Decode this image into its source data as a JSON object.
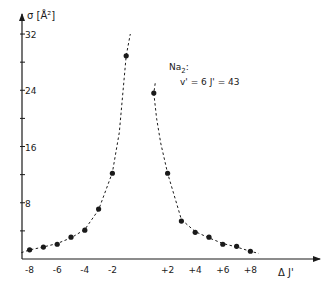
{
  "chart_data": {
    "type": "scatter",
    "title": "",
    "annotation": {
      "line1": "Na",
      "line1_sub": "2",
      "line1_suffix": ":",
      "line2": "v' = 6   J' = 43"
    },
    "xlabel": "Δ J'",
    "ylabel": "σ [Å²]",
    "xlim": [
      -9,
      13
    ],
    "ylim": [
      0,
      34
    ],
    "grid": false,
    "legend": null,
    "x_ticks": [
      -8,
      -7,
      -6,
      -5,
      -4,
      -3,
      -2,
      2,
      3,
      4,
      5,
      6,
      7,
      8
    ],
    "x_tick_labels": [
      {
        "value": -8,
        "label": "-8"
      },
      {
        "value": -6,
        "label": "-6"
      },
      {
        "value": -4,
        "label": "-4"
      },
      {
        "value": -2,
        "label": "-2"
      },
      {
        "value": 2,
        "label": "+2"
      },
      {
        "value": 4,
        "label": "+4"
      },
      {
        "value": 6,
        "label": "+6"
      },
      {
        "value": 8,
        "label": "+8"
      }
    ],
    "y_ticks": [
      4,
      8,
      12,
      16,
      20,
      24,
      28,
      32
    ],
    "y_tick_labels": [
      {
        "value": 8,
        "label": "8"
      },
      {
        "value": 16,
        "label": "16"
      },
      {
        "value": 24,
        "label": "24"
      },
      {
        "value": 32,
        "label": "32"
      }
    ],
    "series": [
      {
        "name": "measured",
        "marker": "filled-circle",
        "x": [
          -8,
          -7,
          -6,
          -5,
          -4,
          -3,
          -2,
          -1,
          1,
          2,
          3,
          4,
          5,
          6,
          7,
          8
        ],
        "y": [
          1.3,
          1.7,
          2.1,
          3.1,
          4.1,
          7.1,
          12.2,
          28.9,
          23.6,
          12.2,
          5.4,
          3.8,
          3.1,
          2.1,
          1.8,
          1.1
        ]
      },
      {
        "name": "fit-left",
        "style": "dashed",
        "x": [
          -8.6,
          -8,
          -7,
          -6,
          -5,
          -4,
          -3,
          -2,
          -1.5,
          -1,
          -0.7
        ],
        "y": [
          0.9,
          1.3,
          1.7,
          2.2,
          3.0,
          4.2,
          7.0,
          12.3,
          18.0,
          28.9,
          32.0
        ]
      },
      {
        "name": "fit-right",
        "style": "dashed",
        "x": [
          1.1,
          1,
          1.2,
          1.5,
          2,
          3,
          4,
          5,
          6,
          7,
          8,
          8.6
        ],
        "y": [
          25.0,
          23.6,
          20.0,
          16.5,
          12.2,
          5.6,
          3.9,
          3.0,
          2.2,
          1.7,
          1.1,
          0.8
        ]
      }
    ],
    "colors": {
      "ink": "#1a1a1a",
      "background": "#ffffff"
    }
  }
}
